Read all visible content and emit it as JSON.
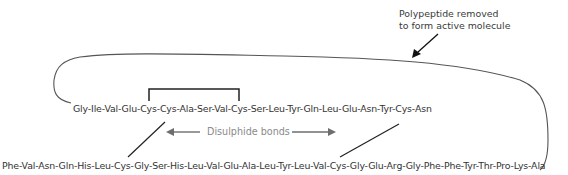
{
  "diagram": {
    "annotation": {
      "line1": "Polypeptide removed",
      "line2": "to form active molecule"
    },
    "chain_a": {
      "sequence": "Gly-Ile-Val-Glu-Cys-Cys-Ala-Ser-Val-Cys-Ser-Leu-Tyr-Gln-Leu-Glu-Asn-Tyr-Cys-Asn"
    },
    "chain_b": {
      "sequence": "Phe-Val-Asn-Gln-His-Leu-Cys-Gly-Ser-His-Leu-Val-Glu-Ala-Leu-Tyr-Leu-Val-Cys-Gly-Glu-Arg-Gly-Phe-Phe-Tyr-Thr-Pro-Lys-Ala"
    },
    "bonds_label": "Disulphide bonds",
    "colors": {
      "text": "#333333",
      "bond_label": "#8a8a8a",
      "lines": "#222222",
      "arrow_gray": "#6e6e6e",
      "curve": "#555555"
    }
  }
}
